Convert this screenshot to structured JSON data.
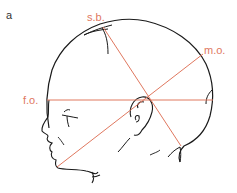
{
  "figure": {
    "panel_label": "a",
    "colors": {
      "outline": "#1a1a1a",
      "measure_line": "#e0785f",
      "label": "#e0785f",
      "background": "#ffffff"
    },
    "diameters": [
      {
        "id": "sb",
        "label": "s.b.",
        "x1": 103,
        "y1": 27,
        "x2": 181,
        "y2": 146
      },
      {
        "id": "mo",
        "label": "m.o.",
        "x1": 203,
        "y1": 54,
        "x2": 57,
        "y2": 167
      },
      {
        "id": "fo",
        "label": "f.o.",
        "x1": 47,
        "y1": 100,
        "x2": 213,
        "y2": 100
      }
    ],
    "intersection": {
      "x": 148,
      "y": 98
    }
  }
}
